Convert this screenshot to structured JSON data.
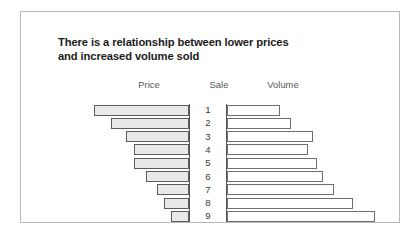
{
  "figure": {
    "title_line1": "There is a relationship between lower prices",
    "title_line2": "and increased volume sold",
    "border_color": "#b9b9b9",
    "background": "#ffffff"
  },
  "chart_data": {
    "type": "bar",
    "orientation": "horizontal",
    "layout": "butterfly",
    "title": "There is a relationship between lower prices and increased volume sold",
    "xlabel": "",
    "ylabel": "Sale",
    "grid": false,
    "legend": "none",
    "center_axis_label": "Sale",
    "categories": [
      "1",
      "2",
      "3",
      "4",
      "5",
      "6",
      "7",
      "8",
      "9"
    ],
    "series": [
      {
        "name": "Price",
        "direction": "left",
        "fill": "#e9e9e9",
        "stroke": "#5c5c5c",
        "values": [
          100,
          82,
          66,
          58,
          58,
          45,
          34,
          26,
          19
        ]
      },
      {
        "name": "Volume",
        "direction": "right",
        "fill": "#ffffff",
        "stroke": "#6e6e6e",
        "values": [
          36,
          43,
          58,
          55,
          61,
          65,
          72,
          85,
          100
        ]
      }
    ],
    "headers": [
      "Price",
      "Sale",
      "Volume"
    ]
  }
}
